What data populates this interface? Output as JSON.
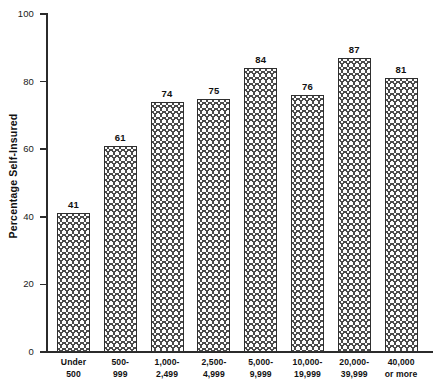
{
  "chart_data": {
    "type": "bar",
    "title": "",
    "xlabel": "",
    "ylabel": "Percentage Self-Insured",
    "ylim": [
      0,
      100
    ],
    "yticks": [
      0,
      20,
      40,
      60,
      80,
      100
    ],
    "grid": false,
    "legend": null,
    "categories": [
      "Under 500",
      "500-999",
      "1,000-2,499",
      "2,500-4,999",
      "5,000-9,999",
      "10,000-19,999",
      "20,000-39,999",
      "40,000 or more"
    ],
    "category_lines": [
      [
        "Under",
        "500"
      ],
      [
        "500-",
        "999"
      ],
      [
        "1,000-",
        "2,499"
      ],
      [
        "2,500-",
        "4,999"
      ],
      [
        "5,000-",
        "9,999"
      ],
      [
        "10,000-",
        "19,999"
      ],
      [
        "20,000-",
        "39,999"
      ],
      [
        "40,000",
        "or more"
      ]
    ],
    "values": [
      41,
      61,
      74,
      75,
      84,
      76,
      87,
      81
    ],
    "value_labels": [
      "41",
      "61",
      "74",
      "75",
      "84",
      "76",
      "87",
      "81"
    ],
    "ytick_labels": [
      "0",
      "20",
      "40",
      "60",
      "80",
      "100"
    ],
    "colors": {
      "bar_fill": "#fdfdfd",
      "bar_hatch": "#4a4a4a",
      "bar_edge": "#2f2f2f",
      "axis": "#2b2b2b",
      "text": "#111111",
      "background": "#ffffff"
    }
  }
}
